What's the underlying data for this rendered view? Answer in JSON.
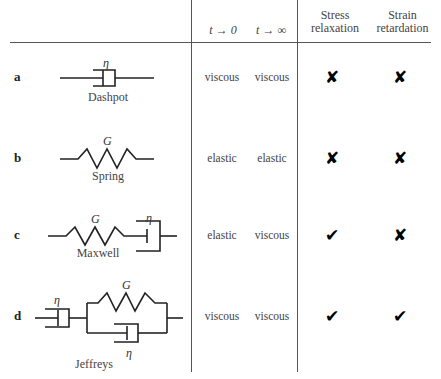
{
  "header": {
    "col_t0": "t → 0",
    "col_tinf": "t → ∞",
    "col_stress": [
      "Stress",
      "relaxation"
    ],
    "col_strain": [
      "Strain",
      "retardation"
    ]
  },
  "rows": [
    {
      "label": "a",
      "model": "Dashpot",
      "t0": "viscous",
      "tinf": "viscous",
      "stress_relaxation": "✘",
      "strain_retardation": "✘",
      "symbols": [
        "η"
      ]
    },
    {
      "label": "b",
      "model": "Spring",
      "t0": "elastic",
      "tinf": "elastic",
      "stress_relaxation": "✘",
      "strain_retardation": "✘",
      "symbols": [
        "G"
      ]
    },
    {
      "label": "c",
      "model": "Maxwell",
      "t0": "elastic",
      "tinf": "viscous",
      "stress_relaxation": "✔",
      "strain_retardation": "✘",
      "symbols": [
        "G",
        "η"
      ]
    },
    {
      "label": "d",
      "model": "Jeffreys",
      "t0": "viscous",
      "tinf": "viscous",
      "stress_relaxation": "✔",
      "strain_retardation": "✔",
      "symbols": [
        "η",
        "G",
        "η"
      ]
    }
  ],
  "colors": {
    "line": "#555555",
    "text": "#444444",
    "mark": "#000000"
  }
}
